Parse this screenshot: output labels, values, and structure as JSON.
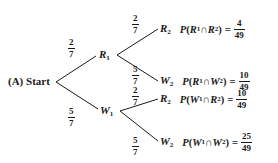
{
  "diagram": {
    "type": "probability-tree",
    "start_label": "(A) Start",
    "level1": [
      {
        "node": "R",
        "sub": "1",
        "prob_num": "2",
        "prob_den": "7"
      },
      {
        "node": "W",
        "sub": "1",
        "prob_num": "5",
        "prob_den": "7"
      }
    ],
    "level2": [
      {
        "parent": "R1",
        "node": "R",
        "sub": "2",
        "prob_num": "2",
        "prob_den": "7",
        "expr_a": "R",
        "expr_a_sub": "1",
        "expr_b": "R",
        "expr_b_sub": "2",
        "result_num": "4",
        "result_den": "49"
      },
      {
        "parent": "R1",
        "node": "W",
        "sub": "2",
        "prob_num": "5",
        "prob_den": "7",
        "expr_a": "R",
        "expr_a_sub": "1",
        "expr_b": "W",
        "expr_b_sub": "2",
        "result_num": "10",
        "result_den": "49"
      },
      {
        "parent": "W1",
        "node": "R",
        "sub": "2",
        "prob_num": "2",
        "prob_den": "7",
        "expr_a": "W",
        "expr_a_sub": "1",
        "expr_b": "R",
        "expr_b_sub": "2",
        "result_num": "10",
        "result_den": "49"
      },
      {
        "parent": "W1",
        "node": "W",
        "sub": "2",
        "prob_num": "5",
        "prob_den": "7",
        "expr_a": "W",
        "expr_a_sub": "1",
        "expr_b": "W",
        "expr_b_sub": "2",
        "result_num": "25",
        "result_den": "49"
      }
    ],
    "symbols": {
      "P": "P",
      "open": "(",
      "cap": " ∩ ",
      "close": ")",
      "eq": "="
    },
    "line_color": "#1a1a1a"
  }
}
